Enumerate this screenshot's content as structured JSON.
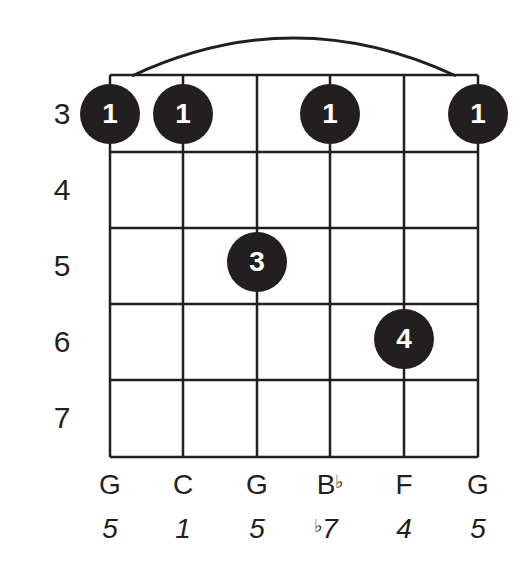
{
  "chord": {
    "type": "guitar-chord-diagram",
    "frets": [
      "3",
      "4",
      "5",
      "6",
      "7"
    ],
    "strings": [
      {
        "note": "G",
        "note_flat": "",
        "degree": "5",
        "degree_flat": ""
      },
      {
        "note": "C",
        "note_flat": "",
        "degree": "1",
        "degree_flat": ""
      },
      {
        "note": "G",
        "note_flat": "",
        "degree": "5",
        "degree_flat": ""
      },
      {
        "note": "B",
        "note_flat": "♭",
        "degree": "7",
        "degree_flat": "♭"
      },
      {
        "note": "F",
        "note_flat": "",
        "degree": "4",
        "degree_flat": ""
      },
      {
        "note": "G",
        "note_flat": "",
        "degree": "5",
        "degree_flat": ""
      }
    ],
    "fingers": [
      {
        "string": 1,
        "fret": 3,
        "finger": "1"
      },
      {
        "string": 2,
        "fret": 3,
        "finger": "1"
      },
      {
        "string": 4,
        "fret": 3,
        "finger": "1"
      },
      {
        "string": 6,
        "fret": 3,
        "finger": "1"
      },
      {
        "string": 3,
        "fret": 5,
        "finger": "3"
      },
      {
        "string": 5,
        "fret": 6,
        "finger": "4"
      }
    ],
    "barre": {
      "fret": 3,
      "from_string": 1,
      "to_string": 6
    },
    "colors": {
      "ink": "#231f20",
      "background": "#ffffff"
    }
  }
}
